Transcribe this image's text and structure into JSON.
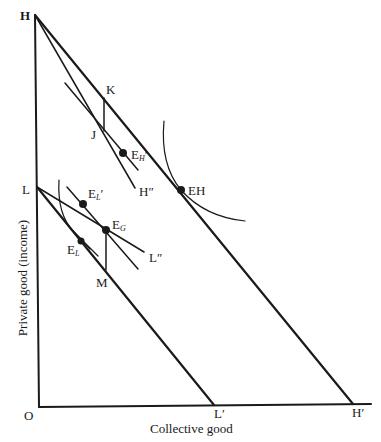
{
  "diagram": {
    "axes": {
      "x_label": "Collective good",
      "y_label": "Private good (income)",
      "origin": "O"
    },
    "points": {
      "H": "H",
      "L": "L",
      "L_prime": "L′",
      "H_prime": "H′",
      "K": "K",
      "J": "J",
      "M": "M",
      "EH": "EH",
      "H_dprime": "H″",
      "L_dprime": "L″",
      "E_H_prime_main": "E",
      "E_H_prime_sub": "H",
      "E_L_prime_main": "E",
      "E_L_prime_sub": "L",
      "E_G_main": "E",
      "E_G_sub": "G",
      "E_L_main": "E",
      "E_L_sub": "L"
    },
    "color": "#1a1a1a"
  }
}
